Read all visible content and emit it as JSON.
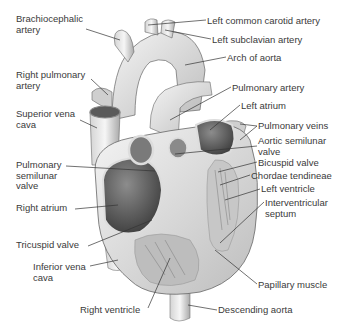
{
  "diagram": {
    "labels_left": [
      {
        "id": "brachiocephalic-artery",
        "lines": [
          "Brachiocephalic",
          "artery"
        ],
        "x": 16,
        "y": 14
      },
      {
        "id": "right-pulmonary-artery",
        "lines": [
          "Right pulmonary",
          "artery"
        ],
        "x": 16,
        "y": 70
      },
      {
        "id": "superior-vena-cava",
        "lines": [
          "Superior vena",
          "cava"
        ],
        "x": 16,
        "y": 109
      },
      {
        "id": "pulmonary-semilunar-valve",
        "lines": [
          "Pulmonary",
          "semilunar",
          "valve"
        ],
        "x": 16,
        "y": 160
      },
      {
        "id": "right-atrium",
        "lines": [
          "Right atrium"
        ],
        "x": 16,
        "y": 203
      },
      {
        "id": "tricuspid-valve",
        "lines": [
          "Tricuspid valve"
        ],
        "x": 16,
        "y": 240
      },
      {
        "id": "inferior-vena-cava",
        "lines": [
          "Inferior vena",
          "cava"
        ],
        "x": 33,
        "y": 262
      },
      {
        "id": "right-ventricle",
        "lines": [
          "Right ventricle"
        ],
        "x": 80,
        "y": 305
      }
    ],
    "labels_right": [
      {
        "id": "left-common-carotid-artery",
        "lines": [
          "Left common carotid artery"
        ],
        "x": 207,
        "y": 16
      },
      {
        "id": "left-subclavian-artery",
        "lines": [
          "Left subclavian  artery"
        ],
        "x": 212,
        "y": 35
      },
      {
        "id": "arch-of-aorta",
        "lines": [
          "Arch of aorta"
        ],
        "x": 227,
        "y": 53
      },
      {
        "id": "pulmonary-artery",
        "lines": [
          "Pulmonary artery"
        ],
        "x": 232,
        "y": 83
      },
      {
        "id": "left-atrium",
        "lines": [
          "Left atrium"
        ],
        "x": 241,
        "y": 101
      },
      {
        "id": "pulmonary-veins",
        "lines": [
          "Pulmonary veins"
        ],
        "x": 258,
        "y": 122
      },
      {
        "id": "aortic-semilunar-valve",
        "lines": [
          "Aortic semilunar",
          "valve"
        ],
        "x": 258,
        "y": 137
      },
      {
        "id": "bicuspid-valve",
        "lines": [
          "Bicuspid valve"
        ],
        "x": 258,
        "y": 158
      },
      {
        "id": "chordae-tendineae",
        "lines": [
          "Chordae tendineae"
        ],
        "x": 251,
        "y": 171
      },
      {
        "id": "left-ventricle",
        "lines": [
          "Left ventricle"
        ],
        "x": 261,
        "y": 185
      },
      {
        "id": "interventricular-septum",
        "lines": [
          "Interventricular",
          "septum"
        ],
        "x": 265,
        "y": 198
      },
      {
        "id": "papillary-muscle",
        "lines": [
          "Papillary muscle"
        ],
        "x": 258,
        "y": 280
      },
      {
        "id": "descending-aorta",
        "lines": [
          "Descending aorta"
        ],
        "x": 218,
        "y": 306
      }
    ]
  }
}
